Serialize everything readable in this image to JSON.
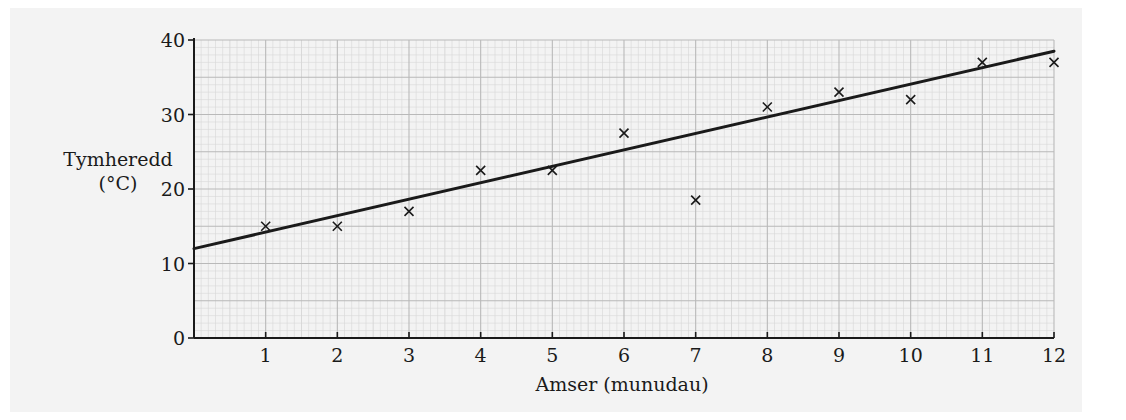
{
  "chart_data": {
    "type": "scatter",
    "title": "",
    "xlabel": "Amser (munudau)",
    "ylabel_lines": [
      "Tymheredd",
      "(°C)"
    ],
    "xlim": [
      0,
      12
    ],
    "ylim": [
      0,
      40
    ],
    "x_ticks": [
      1,
      2,
      3,
      4,
      5,
      6,
      7,
      8,
      9,
      10,
      11,
      12
    ],
    "y_ticks": [
      0,
      10,
      20,
      30,
      40
    ],
    "grid": true,
    "marker": "x",
    "series": [
      {
        "name": "Tymheredd",
        "x": [
          1,
          2,
          3,
          4,
          5,
          6,
          7,
          8,
          9,
          10,
          11,
          12
        ],
        "y": [
          15,
          15,
          17,
          22.5,
          22.5,
          27.5,
          18.5,
          31,
          33,
          32,
          37,
          37
        ]
      }
    ],
    "line_of_best_fit": {
      "x": [
        0,
        12
      ],
      "y": [
        12,
        38.5
      ]
    },
    "colors": {
      "ink": "#1a1a1a",
      "grid_major": "#b9b9b9",
      "grid_minor": "#d6d6d6",
      "background": "#f3f3f3"
    }
  }
}
